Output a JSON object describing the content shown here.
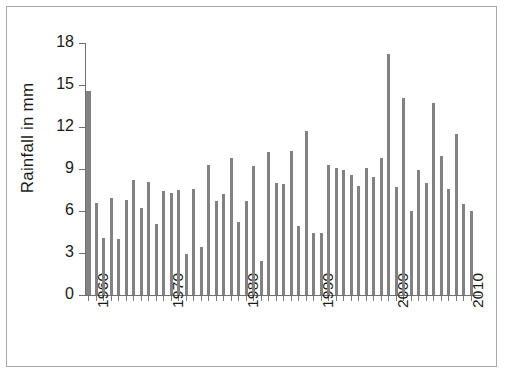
{
  "figure": {
    "border_color": "#a8a8a8",
    "background": "#ffffff"
  },
  "axes": {
    "y_title": "Rainfall  in mm",
    "y_ticks": [
      "0",
      "3",
      "6",
      "9",
      "12",
      "15",
      "18"
    ],
    "x_ticks": [
      "1960",
      "1970",
      "1980",
      "1990",
      "2000",
      "2010"
    ]
  },
  "style": {
    "bar_color": "#828282",
    "axis_color": "#6f6f6f",
    "text_color": "#1a1a1a"
  },
  "chart_data": {
    "type": "bar",
    "title": "",
    "xlabel": "",
    "ylabel": "Rainfall  in mm",
    "ylim": [
      0,
      18
    ],
    "yticks": [
      0,
      3,
      6,
      9,
      12,
      15,
      18
    ],
    "xlim": [
      1959,
      2012
    ],
    "xticks": [
      1960,
      1970,
      1980,
      1990,
      2000,
      2010
    ],
    "grid": false,
    "legend": null,
    "categories": [
      1960,
      1961,
      1962,
      1963,
      1964,
      1965,
      1966,
      1967,
      1968,
      1969,
      1970,
      1971,
      1972,
      1973,
      1974,
      1975,
      1976,
      1977,
      1978,
      1979,
      1980,
      1981,
      1982,
      1983,
      1984,
      1985,
      1986,
      1987,
      1988,
      1989,
      1990,
      1991,
      1992,
      1993,
      1994,
      1995,
      1996,
      1997,
      1998,
      1999,
      2000,
      2001,
      2002,
      2003,
      2004,
      2005,
      2006,
      2007,
      2008,
      2009,
      2010,
      2011
    ],
    "values": [
      14.6,
      6.6,
      4.1,
      6.9,
      4.0,
      6.8,
      8.2,
      6.2,
      8.1,
      5.1,
      7.4,
      7.3,
      7.5,
      2.9,
      7.6,
      3.4,
      9.3,
      6.7,
      7.2,
      9.8,
      5.2,
      6.7,
      9.2,
      2.4,
      10.2,
      8.0,
      7.9,
      10.3,
      4.9,
      11.7,
      4.4,
      4.4,
      9.3,
      9.1,
      8.9,
      8.6,
      7.8,
      9.1,
      8.4,
      9.8,
      17.2,
      7.7,
      14.1,
      6.0,
      8.9,
      8.0,
      13.7,
      9.9,
      7.6,
      11.5,
      6.5,
      6.0
    ],
    "series": [
      {
        "name": "Rainfall",
        "values": [
          14.6,
          6.6,
          4.1,
          6.9,
          4.0,
          6.8,
          8.2,
          6.2,
          8.1,
          5.1,
          7.4,
          7.3,
          7.5,
          2.9,
          7.6,
          3.4,
          9.3,
          6.7,
          7.2,
          9.8,
          5.2,
          6.7,
          9.2,
          2.4,
          10.2,
          8.0,
          7.9,
          10.3,
          4.9,
          11.7,
          4.4,
          4.4,
          9.3,
          9.1,
          8.9,
          8.6,
          7.8,
          9.1,
          8.4,
          9.8,
          17.2,
          7.7,
          14.1,
          6.0,
          8.9,
          8.0,
          13.7,
          9.9,
          7.6,
          11.5,
          6.5,
          6.0
        ]
      }
    ]
  }
}
